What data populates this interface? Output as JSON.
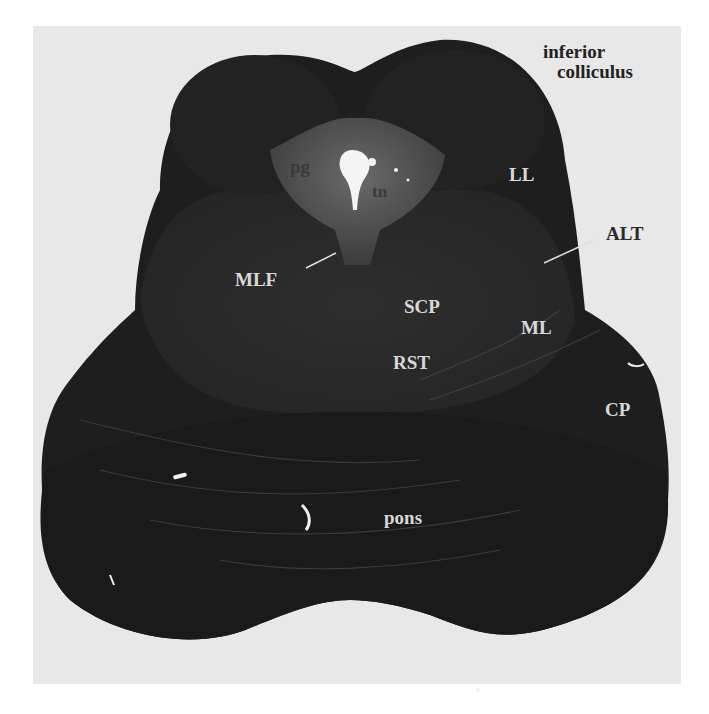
{
  "figure": {
    "region_title": {
      "line1": "inferior",
      "line2": "colliculus"
    },
    "labels": {
      "pg": "pg",
      "tn": "tn",
      "LL": "LL",
      "ALT": "ALT",
      "MLF": "MLF",
      "SCP": "SCP",
      "ML": "ML",
      "RST": "RST",
      "CP": "CP",
      "pons": "pons"
    },
    "colors": {
      "background": "#e8e8e8",
      "tissue_dark": "#1c1c1c",
      "tissue_mid": "#3a3a3a",
      "periaqueductal_gray": "#5a5a5a",
      "aqueduct": "#f4f4f4"
    }
  }
}
